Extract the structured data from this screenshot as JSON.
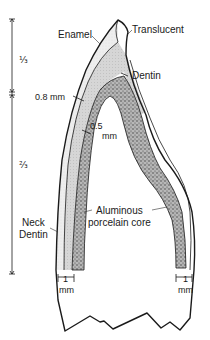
{
  "diagram": {
    "labels": {
      "enamel": "Enamel",
      "translucent": "Translucent",
      "dentin": "Dentin",
      "thickness_incisal": "0.8 mm",
      "thickness_core_num": "0.5",
      "thickness_core_unit": "mm",
      "neck_line1": "Neck",
      "neck_line2": "Dentin",
      "core_line1": "Aluminous",
      "core_line2": "porcelain core",
      "shoulder_left_num": "1",
      "shoulder_left_unit": "mm",
      "shoulder_right_num": "1",
      "shoulder_right_unit": "mm"
    },
    "scale": {
      "upper_fraction": "⅓",
      "lower_fraction": "⅔"
    },
    "colors": {
      "line": "#1a1a1a",
      "enamel_fill": "#ececec",
      "dentin_fill": "#cfcfcf",
      "core_fill": "#8a8a8a",
      "background": "#ffffff"
    }
  }
}
